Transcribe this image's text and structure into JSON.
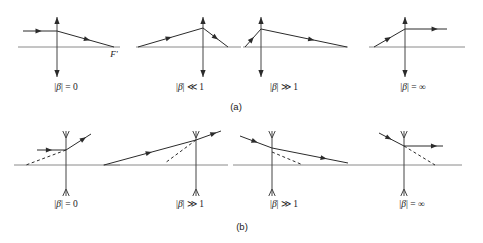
{
  "figure": {
    "width": 483,
    "height": 243,
    "background": "#ffffff",
    "ray_color": "#2b2b2b",
    "axis_color": "#8a8a8a",
    "lens_color": "#444444"
  },
  "symbols": {
    "beta_abs": "|β|",
    "equals": "=",
    "much_less": "≪",
    "much_greater": "≫",
    "zero": "0",
    "one": "1",
    "infinity": "∞",
    "focal_point": "F'"
  },
  "rows": [
    {
      "id": "row-a",
      "caption": "(a)",
      "caption_x": 236,
      "caption_y": 110,
      "lens_type": "converging",
      "axis": {
        "y": 47
      },
      "panels": [
        {
          "id": "panel-a1",
          "label": "|β| = 0",
          "label_x": 66,
          "label_y": 90,
          "lens_x": 57,
          "axis_x1": 18,
          "axis_x2": 120,
          "lens_top": 17,
          "lens_bottom": 77,
          "incoming": {
            "x1": 23,
            "y1": 31,
            "x2": 57,
            "y2": 31,
            "arrow_at": 0.55
          },
          "outgoing": {
            "x1": 57,
            "y1": 31,
            "x2": 114,
            "y2": 47,
            "arrow_at": 0.58
          },
          "focal_label": {
            "text": "F'",
            "x": 114,
            "y": 57
          }
        },
        {
          "id": "panel-a2",
          "label": "|β| ≪ 1",
          "label_x": 190,
          "label_y": 90,
          "lens_x": 203,
          "axis_x1": 136,
          "axis_x2": 241,
          "lens_top": 17,
          "lens_bottom": 77,
          "incoming": {
            "x1": 138,
            "y1": 47,
            "x2": 203,
            "y2": 28,
            "arrow_at": 0.52
          },
          "outgoing": {
            "x1": 203,
            "y1": 28,
            "x2": 228,
            "y2": 47,
            "arrow_at": 0.6
          }
        },
        {
          "id": "panel-a3",
          "label": "|β| ≫ 1",
          "label_x": 284,
          "label_y": 90,
          "lens_x": 261,
          "axis_x1": 243,
          "axis_x2": 348,
          "lens_top": 17,
          "lens_bottom": 77,
          "incoming": {
            "x1": 245,
            "y1": 47,
            "x2": 261,
            "y2": 29,
            "arrow_at": 0.55
          },
          "outgoing": {
            "x1": 261,
            "y1": 29,
            "x2": 347,
            "y2": 47,
            "arrow_at": 0.62
          }
        },
        {
          "id": "panel-a4",
          "label": "|β| = ∞",
          "label_x": 413,
          "label_y": 90,
          "lens_x": 405,
          "axis_x1": 369,
          "axis_x2": 465,
          "lens_top": 17,
          "lens_bottom": 77,
          "incoming": {
            "x1": 374,
            "y1": 47,
            "x2": 405,
            "y2": 29,
            "arrow_at": 0.55
          },
          "outgoing": {
            "x1": 405,
            "y1": 29,
            "x2": 447,
            "y2": 29,
            "arrow_at": 0.78
          }
        }
      ]
    },
    {
      "id": "row-b",
      "caption": "(b)",
      "caption_x": 242,
      "caption_y": 230,
      "lens_type": "diverging",
      "axis": {
        "y": 165
      },
      "panels": [
        {
          "id": "panel-b1",
          "label": "|β| = 0",
          "label_x": 66,
          "label_y": 207,
          "lens_x": 66,
          "axis_x1": 14,
          "axis_x2": 120,
          "lens_top": 131,
          "lens_bottom": 196,
          "incoming": {
            "x1": 37,
            "y1": 150,
            "x2": 66,
            "y2": 150,
            "arrow_at": 0.52
          },
          "outgoing": {
            "x1": 66,
            "y1": 150,
            "x2": 91,
            "y2": 134,
            "arrow_at": 0.8
          },
          "virtual": {
            "x1": 66,
            "y1": 150,
            "x2": 26,
            "y2": 165
          }
        },
        {
          "id": "panel-b2",
          "label": "|β| ≫ 1",
          "label_x": 190,
          "label_y": 207,
          "lens_x": 196,
          "axis_x1": 103,
          "axis_x2": 228,
          "lens_top": 131,
          "lens_bottom": 196,
          "incoming": {
            "x1": 104,
            "y1": 165,
            "x2": 196,
            "y2": 140,
            "arrow_at": 0.52
          },
          "outgoing": {
            "x1": 196,
            "y1": 140,
            "x2": 221,
            "y2": 131,
            "arrow_at": 0.82
          },
          "virtual": {
            "x1": 196,
            "y1": 140,
            "x2": 165,
            "y2": 163
          }
        },
        {
          "id": "panel-b3",
          "label": "|β| ≫ 1",
          "label_x": 284,
          "label_y": 207,
          "lens_x": 272,
          "axis_x1": 233,
          "axis_x2": 350,
          "lens_top": 131,
          "lens_bottom": 196,
          "incoming": {
            "x1": 240,
            "y1": 136,
            "x2": 272,
            "y2": 148,
            "arrow_at": 0.55
          },
          "outgoing": {
            "x1": 272,
            "y1": 148,
            "x2": 348,
            "y2": 163,
            "arrow_at": 0.72
          },
          "virtual": {
            "x1": 272,
            "y1": 152,
            "x2": 303,
            "y2": 165
          }
        },
        {
          "id": "panel-b4",
          "label": "|β| = ∞",
          "label_x": 412,
          "label_y": 207,
          "lens_x": 404,
          "axis_x1": 350,
          "axis_x2": 462,
          "lens_top": 131,
          "lens_bottom": 196,
          "incoming": {
            "x1": 379,
            "y1": 133,
            "x2": 404,
            "y2": 146,
            "arrow_at": 0.5
          },
          "outgoing": {
            "x1": 404,
            "y1": 146,
            "x2": 443,
            "y2": 146,
            "arrow_at": 0.85
          },
          "virtual": {
            "x1": 404,
            "y1": 146,
            "x2": 435,
            "y2": 165
          }
        }
      ]
    }
  ]
}
